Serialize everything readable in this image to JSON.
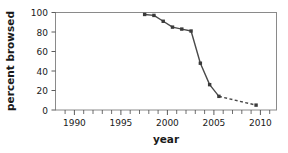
{
  "chart_data": {
    "type": "line",
    "title": "",
    "xlabel": "year",
    "ylabel": "percent browsed",
    "xlim": [
      1988.4,
      1.0
    ],
    "x_min": 1988.4,
    "x_max": 2012.2,
    "ylim": [
      0,
      100
    ],
    "grid": false,
    "legend": null,
    "x_ticks_major": [
      1990,
      1995,
      2000,
      2005,
      2010
    ],
    "x_tick_labels": [
      "1990",
      "1995",
      "2000",
      "2005",
      "2010"
    ],
    "x_ticks_minor": [
      1989,
      1991,
      1992,
      1993,
      1994,
      1996,
      1997,
      1998,
      1999,
      2001,
      2002,
      2003,
      2004,
      2006,
      2007,
      2008,
      2009,
      2011,
      2012
    ],
    "y_ticks": [
      0,
      20,
      40,
      60,
      80,
      100
    ],
    "y_tick_labels": [
      "0",
      "20",
      "40",
      "60",
      "80",
      "100"
    ],
    "x": [
      1998,
      1999,
      2000,
      2001,
      2002,
      2003,
      2004,
      2005,
      2006,
      2010
    ],
    "values": [
      98,
      97,
      91,
      85,
      83,
      81,
      48,
      26,
      14,
      5
    ],
    "series": [
      {
        "name": "percent browsed",
        "x": [
          1998,
          1999,
          2000,
          2001,
          2002,
          2003,
          2004,
          2005,
          2006,
          2010
        ],
        "values": [
          98,
          97,
          91,
          85,
          83,
          81,
          48,
          26,
          14,
          5
        ],
        "marker": "square",
        "color": "#4a4a4a",
        "solid_until_x": 2006,
        "dashed_from_x": 2006
      }
    ],
    "annotations": []
  },
  "axes": {
    "x_title": "year",
    "y_title": "percent browsed"
  }
}
